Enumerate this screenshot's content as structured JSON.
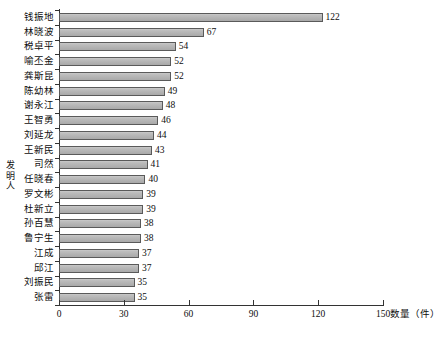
{
  "chart_data": {
    "type": "bar",
    "orientation": "horizontal",
    "title": "",
    "xlabel": "数量（件）",
    "ylabel": "发明人",
    "xlim": [
      0,
      150
    ],
    "xticks": [
      0,
      30,
      60,
      90,
      120,
      150
    ],
    "grid": false,
    "legend": null,
    "categories": [
      "钱振地",
      "林晓波",
      "税卓平",
      "喻丕金",
      "龚斯昆",
      "陈幼林",
      "谢永江",
      "王智勇",
      "刘延龙",
      "王新民",
      "司然",
      "任晓春",
      "罗文彬",
      "杜新立",
      "孙百慧",
      "鲁宁生",
      "江成",
      "邱江",
      "刘振民",
      "张雷"
    ],
    "values": [
      122,
      67,
      54,
      52,
      52,
      49,
      48,
      46,
      44,
      43,
      41,
      40,
      39,
      39,
      38,
      38,
      37,
      37,
      35,
      35
    ],
    "data_labels": [
      "122",
      "67",
      "54",
      "52",
      "52",
      "49",
      "48",
      "46",
      "44",
      "43",
      "41",
      "40",
      "39",
      "39",
      "38",
      "38",
      "37",
      "37",
      "35",
      "35"
    ],
    "bar_color": "#b8b8b8",
    "bar_border_color": "#5a5a5a",
    "axis_color": "#333333"
  },
  "axis": {
    "y_title_chars": [
      "发",
      "明",
      "人"
    ],
    "x_title": "数量（件）",
    "x_tick_labels": [
      "0",
      "30",
      "60",
      "90",
      "120",
      "150"
    ]
  },
  "caption": {
    "text": ""
  }
}
